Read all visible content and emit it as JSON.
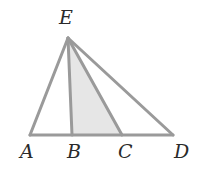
{
  "diagram": {
    "type": "geometry-triangle",
    "colors": {
      "line": "#9a9a9a",
      "shade": "#e6e6e6",
      "label": "#2a2a2a",
      "background": "#ffffff"
    },
    "points": {
      "E": {
        "label": "E",
        "x": 68,
        "y": 38,
        "lx": 66,
        "ly": 24
      },
      "A": {
        "label": "A",
        "x": 30,
        "y": 135,
        "lx": 27,
        "ly": 158
      },
      "B": {
        "label": "B",
        "x": 72,
        "y": 135,
        "lx": 74,
        "ly": 158
      },
      "C": {
        "label": "C",
        "x": 122,
        "y": 135,
        "lx": 125,
        "ly": 158
      },
      "D": {
        "label": "D",
        "x": 173,
        "y": 135,
        "lx": 181,
        "ly": 158
      }
    },
    "segments": [
      "EA",
      "EB",
      "EC",
      "ED",
      "AD"
    ],
    "shaded_region": "triangle EBC"
  }
}
